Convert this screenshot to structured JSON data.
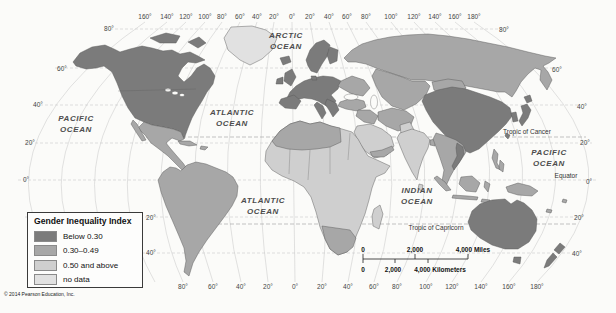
{
  "colors": {
    "below_030": "#7b7b7b",
    "mid_030_049": "#a7a7a7",
    "high_050": "#cfcfcf",
    "no_data": "#e1e1e1",
    "ocean": "#fbfbf9",
    "graticule": "#c9c9c9",
    "tropic": "#9a9a9a",
    "border": "#585858"
  },
  "legend": {
    "title": "Gender Inequality Index",
    "items": [
      {
        "label": "Below 0.30",
        "category": "below_030"
      },
      {
        "label": "0.30–0.49",
        "category": "mid_030_049"
      },
      {
        "label": "0.50 and above",
        "category": "high_050"
      },
      {
        "label": "no data",
        "category": "no_data"
      }
    ]
  },
  "copyright": "© 2014 Pearson Education, Inc.",
  "ocean_labels": [
    {
      "name": "arctic-ocean-label",
      "lines": [
        "ARCTIC",
        "OCEAN"
      ],
      "x": 286,
      "y": 38
    },
    {
      "name": "pacific-ocean-nw-label",
      "lines": [
        "PACIFIC",
        "OCEAN"
      ],
      "x": 76,
      "y": 121
    },
    {
      "name": "atlantic-ocean-n-label",
      "lines": [
        "ATLANTIC",
        "OCEAN"
      ],
      "x": 232,
      "y": 115
    },
    {
      "name": "atlantic-ocean-s-label",
      "lines": [
        "ATLANTIC",
        "OCEAN"
      ],
      "x": 263,
      "y": 203
    },
    {
      "name": "indian-ocean-label",
      "lines": [
        "INDIAN",
        "OCEAN"
      ],
      "x": 417,
      "y": 193
    },
    {
      "name": "pacific-ocean-e-label",
      "lines": [
        "PACIFIC",
        "OCEAN"
      ],
      "x": 549,
      "y": 155
    }
  ],
  "reference_lines": [
    {
      "name": "tropic-of-cancer-label",
      "label": "Tropic of Cancer",
      "x": 527,
      "y": 134
    },
    {
      "name": "equator-label",
      "label": "Equator",
      "x": 566,
      "y": 178
    },
    {
      "name": "tropic-of-capricorn-label",
      "label": "Tropic of Capricorn",
      "x": 436,
      "y": 230
    }
  ],
  "graticule_labels": {
    "top": [
      {
        "t": "160°",
        "x": 145
      },
      {
        "t": "140°",
        "x": 167
      },
      {
        "t": "120°",
        "x": 186
      },
      {
        "t": "100°",
        "x": 205
      },
      {
        "t": "80°",
        "x": 222
      },
      {
        "t": "60°",
        "x": 240
      },
      {
        "t": "40°",
        "x": 257
      },
      {
        "t": "20°",
        "x": 274
      },
      {
        "t": "0°",
        "x": 292
      },
      {
        "t": "20°",
        "x": 310
      },
      {
        "t": "40°",
        "x": 329
      },
      {
        "t": "60°",
        "x": 347
      },
      {
        "t": "80°",
        "x": 366
      },
      {
        "t": "100°",
        "x": 391
      },
      {
        "t": "120°",
        "x": 414
      },
      {
        "t": "140°",
        "x": 435
      },
      {
        "t": "160°",
        "x": 455
      },
      {
        "t": "180°",
        "x": 474
      }
    ],
    "bottom": [
      {
        "t": "80°",
        "x": 183
      },
      {
        "t": "60°",
        "x": 213
      },
      {
        "t": "40°",
        "x": 241
      },
      {
        "t": "20°",
        "x": 268
      },
      {
        "t": "0°",
        "x": 295
      },
      {
        "t": "20°",
        "x": 322
      },
      {
        "t": "40°",
        "x": 348
      },
      {
        "t": "60°",
        "x": 374
      },
      {
        "t": "80°",
        "x": 397
      },
      {
        "t": "100°",
        "x": 426
      },
      {
        "t": "120°",
        "x": 452
      },
      {
        "t": "140°",
        "x": 481
      },
      {
        "t": "160°",
        "x": 509
      },
      {
        "t": "180°",
        "x": 537
      }
    ],
    "left": [
      {
        "t": "80°",
        "x": 109,
        "y": 31
      },
      {
        "t": "60°",
        "x": 62,
        "y": 71
      },
      {
        "t": "40°",
        "x": 38,
        "y": 107
      },
      {
        "t": "20°",
        "x": 30,
        "y": 145
      },
      {
        "t": "0°",
        "x": 26,
        "y": 182
      },
      {
        "t": "20°",
        "x": 151,
        "y": 220
      },
      {
        "t": "40°",
        "x": 151,
        "y": 255
      }
    ],
    "right": [
      {
        "t": "80°",
        "x": 504,
        "y": 32
      },
      {
        "t": "60°",
        "x": 557,
        "y": 72
      },
      {
        "t": "40°",
        "x": 582,
        "y": 109
      },
      {
        "t": "20°",
        "x": 585,
        "y": 145
      },
      {
        "t": "0°",
        "x": 589,
        "y": 184
      },
      {
        "t": "20°",
        "x": 579,
        "y": 220
      },
      {
        "t": "40°",
        "x": 577,
        "y": 256
      }
    ]
  },
  "scale_bar": {
    "miles": [
      {
        "t": "0",
        "x": 363
      },
      {
        "t": "2,000",
        "x": 415
      },
      {
        "t": "4,000 Miles",
        "x": 473
      }
    ],
    "kilometers": [
      {
        "t": "0",
        "x": 363
      },
      {
        "t": "2,000",
        "x": 393
      },
      {
        "t": "4,000 Kilometers",
        "x": 440
      }
    ]
  },
  "regions": {
    "canada-usa": "below_030",
    "arctic-islands-1": "below_030",
    "arctic-islands-2": "below_030",
    "greenland": "no_data",
    "iceland": "below_030",
    "mexico-central-america": "mid_030_049",
    "baja-california": "mid_030_049",
    "cuba": "mid_030_049",
    "hispaniola": "mid_030_049",
    "south-america": "mid_030_049",
    "europe-west": "below_030",
    "italy": "below_030",
    "balkans": "below_030",
    "iberia": "below_030",
    "uk": "below_030",
    "ireland": "below_030",
    "scandinavia": "below_030",
    "finland": "below_030",
    "denmark": "below_030",
    "eastern-europe": "mid_030_049",
    "russia": "mid_030_049",
    "central-asia": "mid_030_049",
    "mongolia": "mid_030_049",
    "turkey": "mid_030_049",
    "iraq-syria": "mid_030_049",
    "iran-afghanistan": "mid_030_049",
    "pakistan": "high_050",
    "arabia": "high_050",
    "yemen-oman": "mid_030_049",
    "africa": "high_050",
    "north-africa": "mid_030_049",
    "southern-africa": "mid_030_049",
    "madagascar": "high_050",
    "india": "high_050",
    "sri-lanka": "high_050",
    "bangladesh": "mid_030_049",
    "china": "below_030",
    "korea": "below_030",
    "japan-hokkaido": "below_030",
    "japan-honshu": "below_030",
    "taiwan": "below_030",
    "southeast-asia": "mid_030_049",
    "vietnam": "below_030",
    "philippines-1": "mid_030_049",
    "philippines-2": "mid_030_049",
    "sumatra": "mid_030_049",
    "java": "mid_030_049",
    "borneo": "mid_030_049",
    "sulawesi": "mid_030_049",
    "lesser-sunda": "mid_030_049",
    "new-guinea": "mid_030_049",
    "australia": "below_030",
    "tasmania": "below_030",
    "nz-north": "below_030",
    "nz-south": "below_030",
    "pacific-island-1": "mid_030_049",
    "pacific-island-2": "mid_030_049"
  }
}
